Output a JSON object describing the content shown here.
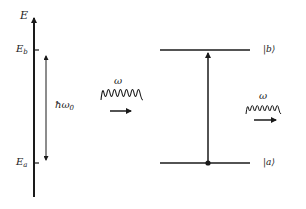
{
  "energy_axis": {
    "label": "E",
    "upper_level_label": "E",
    "upper_level_sub": "b",
    "lower_level_label": "E",
    "lower_level_sub": "a",
    "gap_label_hbar": "ħω",
    "gap_label_sub": "0"
  },
  "incoming_photon": {
    "label": "ω"
  },
  "outgoing_photon": {
    "label": "ω"
  },
  "states": {
    "upper": "|b⟩",
    "lower": "|a⟩"
  },
  "colors": {
    "stroke": "#1a1a1a",
    "text": "#222222",
    "background": "#ffffff"
  }
}
